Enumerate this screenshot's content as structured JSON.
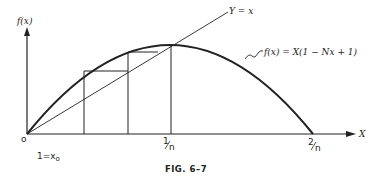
{
  "figure": {
    "caption": "FIG. 6–7",
    "colors": {
      "ink": "#222222",
      "background": "#ffffff"
    }
  },
  "axes": {
    "y_label": "f(x)",
    "x_label": "X",
    "origin_label": "o",
    "x_ticks": [
      {
        "label": "1/n",
        "num": "1",
        "den": "n"
      },
      {
        "label": "2/n",
        "num": "2",
        "den": "n"
      }
    ],
    "x0_label_main": "1=x",
    "x0_label_sub": "o"
  },
  "curves": {
    "identity_line_label": "Y = x",
    "parabola_label": "f(x) = X(1 − Nx + 1)"
  }
}
